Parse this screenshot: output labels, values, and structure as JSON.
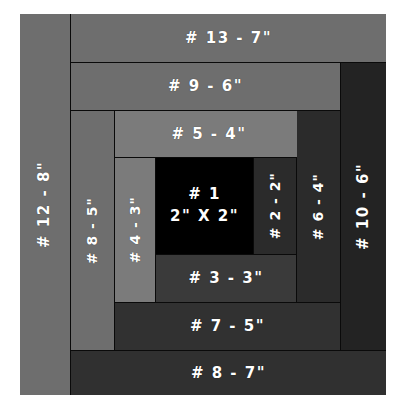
{
  "diagram": {
    "colors": {
      "seam": "#0a0a0a",
      "light_gray": "#8a8a8a",
      "medium_gray": "#636363",
      "dark_gray": "#333333",
      "darker_gray": "#262626",
      "near_black": "#1f1f1f",
      "black": "#000000",
      "label_text": "#ffffff",
      "page_background": "#ffffff"
    },
    "pieces": [
      {
        "id": "piece-1",
        "number": "1",
        "label": "# 1\n2\" X 2\"",
        "size": "2\" X 2\"",
        "orientation": "horizontal",
        "color": "#000000",
        "x": 136,
        "y": 144,
        "w": 97,
        "h": 96
      },
      {
        "id": "piece-2",
        "number": "2",
        "label": "# 2 - 2\"",
        "size": "2\"",
        "orientation": "vertical",
        "color": "#2b2b2b",
        "x": 234,
        "y": 144,
        "w": 42,
        "h": 96
      },
      {
        "id": "piece-3",
        "number": "3",
        "label": "# 3 - 3\"",
        "size": "3\"",
        "orientation": "horizontal",
        "color": "#3a3a3a",
        "x": 136,
        "y": 241,
        "w": 140,
        "h": 47
      },
      {
        "id": "piece-4",
        "number": "4",
        "label": "# 4 - 3\"",
        "size": "3\"",
        "orientation": "vertical",
        "color": "#7b7b7b",
        "x": 95,
        "y": 144,
        "w": 40,
        "h": 144
      },
      {
        "id": "piece-5",
        "number": "5",
        "label": "# 5 - 4\"",
        "size": "4\"",
        "orientation": "horizontal",
        "color": "#7b7b7b",
        "x": 95,
        "y": 97,
        "w": 188,
        "h": 46
      },
      {
        "id": "piece-6",
        "number": "6",
        "label": "# 6 - 4\"",
        "size": "4\"",
        "orientation": "vertical",
        "color": "#2b2b2b",
        "x": 277,
        "y": 97,
        "w": 43,
        "h": 191
      },
      {
        "id": "piece-7",
        "number": "7",
        "label": "# 7 - 5\"",
        "size": "5\"",
        "orientation": "horizontal",
        "color": "#313131",
        "x": 95,
        "y": 289,
        "w": 225,
        "h": 47
      },
      {
        "id": "piece-8-left",
        "number": "8",
        "label": "# 8 - 5\"",
        "size": "5\"",
        "orientation": "vertical",
        "color": "#6e6e6e",
        "x": 51,
        "y": 97,
        "w": 43,
        "h": 239
      },
      {
        "id": "piece-9",
        "number": "9",
        "label": "# 9 - 6\"",
        "size": "6\"",
        "orientation": "horizontal",
        "color": "#6e6e6e",
        "x": 51,
        "y": 49,
        "w": 269,
        "h": 47
      },
      {
        "id": "piece-10",
        "number": "10",
        "label": "# 10 - 6\"",
        "size": "6\"",
        "orientation": "vertical",
        "color": "#232323",
        "x": 321,
        "y": 49,
        "w": 45,
        "h": 287
      },
      {
        "id": "piece-8-bottom",
        "number": "8",
        "label": "# 8 - 7\"",
        "size": "7\"",
        "orientation": "horizontal",
        "color": "#303030",
        "x": 51,
        "y": 337,
        "w": 315,
        "h": 44
      },
      {
        "id": "piece-12",
        "number": "12",
        "label": "# 12 - 8\"",
        "size": "8\"",
        "orientation": "vertical",
        "color": "#6e6e6e",
        "x": 0,
        "y": 0,
        "w": 50,
        "h": 381
      },
      {
        "id": "piece-13",
        "number": "13",
        "label": "# 13 - 7\"",
        "size": "7\"",
        "orientation": "horizontal",
        "color": "#6e6e6e",
        "x": 51,
        "y": 0,
        "w": 315,
        "h": 48
      }
    ]
  }
}
